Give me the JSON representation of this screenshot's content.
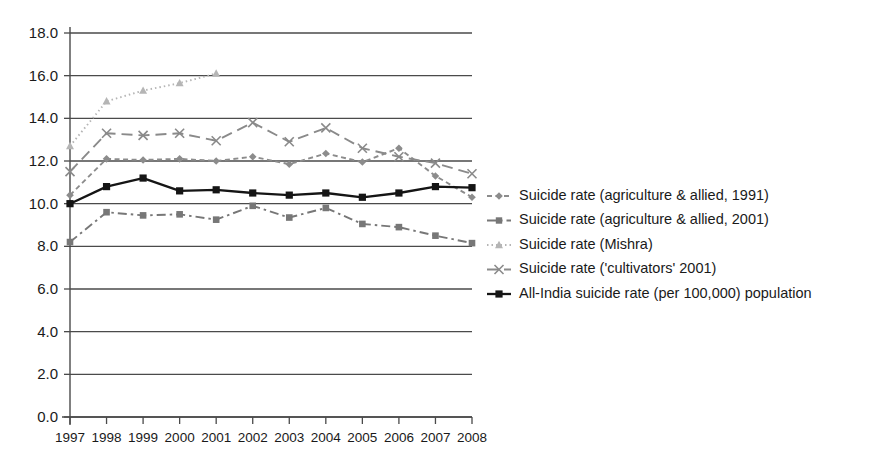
{
  "chart_data": {
    "type": "line",
    "title": "",
    "subtitle": "",
    "xlabel": "",
    "ylabel": "",
    "xlim": [
      1997,
      2008
    ],
    "ylim": [
      0.0,
      18.0
    ],
    "ytick_step": 2.0,
    "grid": "horizontal",
    "legend_position": "right",
    "categories": [
      "1997",
      "1998",
      "1999",
      "2000",
      "2001",
      "2002",
      "2003",
      "2004",
      "2005",
      "2006",
      "2007",
      "2008"
    ],
    "ytick_labels": [
      "18.0",
      "16.0",
      "14.0",
      "12.0",
      "10.0",
      "8.0",
      "6.0",
      "4.0",
      "2.0",
      "0.0"
    ],
    "ytick_values": [
      18.0,
      16.0,
      14.0,
      12.0,
      10.0,
      8.0,
      6.0,
      4.0,
      2.0,
      0.0
    ],
    "series": [
      {
        "name": "Suicide rate (agriculture & allied, 1991)",
        "marker": "diamond",
        "dash": "dashed",
        "color": "#8c8c8c",
        "x": [
          "1997",
          "1998",
          "1999",
          "2000",
          "2001",
          "2002",
          "2003",
          "2004",
          "2005",
          "2006",
          "2007",
          "2008"
        ],
        "values": [
          10.4,
          12.1,
          12.05,
          12.1,
          12.0,
          12.2,
          11.85,
          12.35,
          11.95,
          12.6,
          11.3,
          10.3
        ]
      },
      {
        "name": "Suicide rate (agriculture & allied, 2001)",
        "marker": "square",
        "dash": "dash-dot",
        "color": "#777777",
        "x": [
          "1997",
          "1998",
          "1999",
          "2000",
          "2001",
          "2002",
          "2003",
          "2004",
          "2005",
          "2006",
          "2007",
          "2008"
        ],
        "values": [
          8.2,
          9.6,
          9.45,
          9.5,
          9.25,
          9.9,
          9.35,
          9.8,
          9.05,
          8.9,
          8.5,
          8.15
        ]
      },
      {
        "name": "Suicide rate (Mishra)",
        "marker": "triangle",
        "dash": "dotted",
        "color": "#b5b5b5",
        "x": [
          "1997",
          "1998",
          "1999",
          "2000",
          "2001"
        ],
        "values": [
          12.7,
          14.8,
          15.3,
          15.65,
          16.1
        ]
      },
      {
        "name": "Suicide rate ('cultivators' 2001)",
        "marker": "x",
        "dash": "long-dash",
        "color": "#8a8a8a",
        "x": [
          "1997",
          "1998",
          "1999",
          "2000",
          "2001",
          "2002",
          "2003",
          "2004",
          "2005",
          "2006",
          "2007",
          "2008"
        ],
        "values": [
          11.5,
          13.3,
          13.2,
          13.3,
          12.95,
          13.8,
          12.9,
          13.55,
          12.6,
          12.2,
          11.9,
          11.4
        ]
      },
      {
        "name": "All-India suicide rate (per 100,000) population",
        "marker": "square",
        "dash": "solid",
        "color": "#151515",
        "x": [
          "1997",
          "1998",
          "1999",
          "2000",
          "2001",
          "2002",
          "2003",
          "2004",
          "2005",
          "2006",
          "2007",
          "2008"
        ],
        "values": [
          10.0,
          10.8,
          11.2,
          10.6,
          10.65,
          10.5,
          10.4,
          10.5,
          10.3,
          10.5,
          10.8,
          10.75
        ]
      }
    ]
  },
  "legend": {
    "items": [
      {
        "label": "Suicide rate (agriculture & allied, 1991)"
      },
      {
        "label": "Suicide rate (agriculture & allied, 2001)"
      },
      {
        "label": "Suicide rate (Mishra)"
      },
      {
        "label": "Suicide rate ('cultivators' 2001)"
      },
      {
        "label": "All-India suicide rate (per 100,000) population"
      }
    ]
  }
}
